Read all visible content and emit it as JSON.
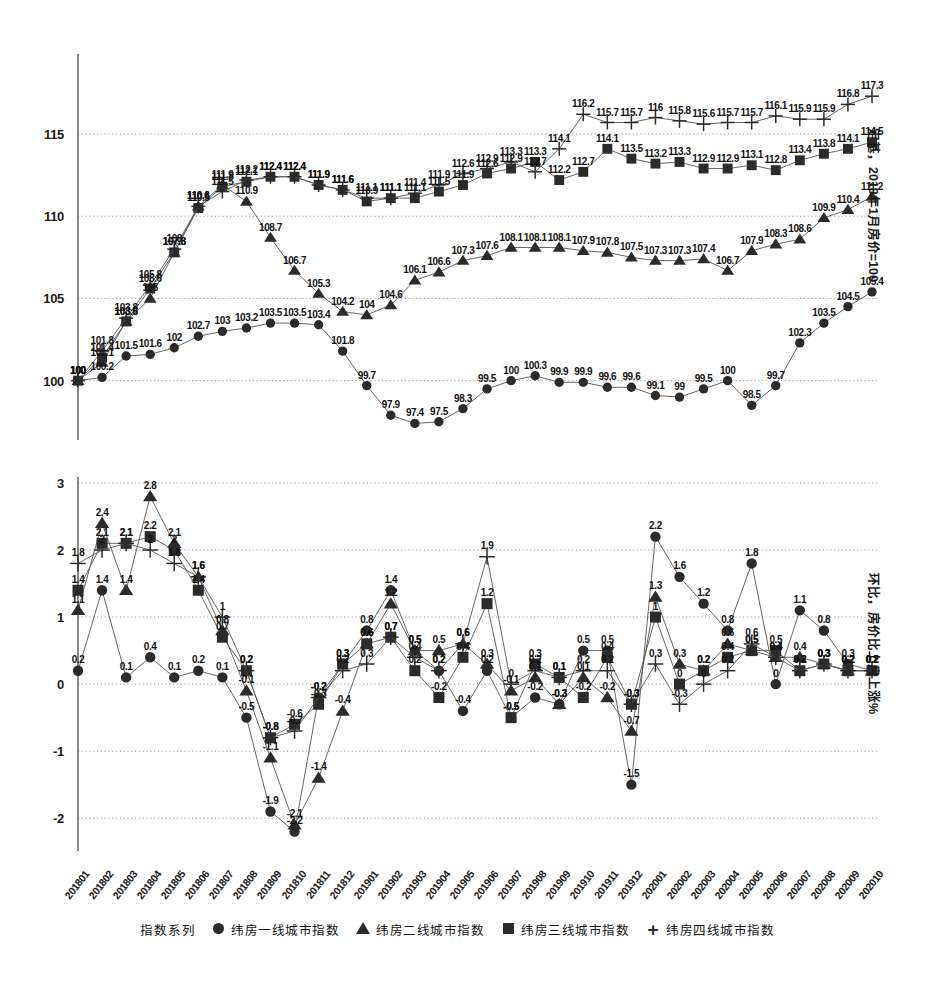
{
  "figure": {
    "background": "#ffffff",
    "ink_color": "#2b2b2b",
    "grid_color": "#9a9a9a"
  },
  "legend": {
    "title": "指数系列",
    "items": [
      {
        "label": "纬房一线城市指数",
        "marker": "circle-marker-icon",
        "key": "tier1"
      },
      {
        "label": "纬房二线城市指数",
        "marker": "triangle-marker-icon",
        "key": "tier2"
      },
      {
        "label": "纬房三线城市指数",
        "marker": "square-marker-icon",
        "key": "tier3"
      },
      {
        "label": "纬房四线城市指数",
        "marker": "plus-marker-icon",
        "key": "tier4"
      }
    ]
  },
  "categories": [
    "201801",
    "201802",
    "201803",
    "201804",
    "201805",
    "201806",
    "201807",
    "201808",
    "201809",
    "201810",
    "201811",
    "201812",
    "201901",
    "201902",
    "201903",
    "201904",
    "201905",
    "201906",
    "201907",
    "201908",
    "201909",
    "201910",
    "201911",
    "201912",
    "202001",
    "202002",
    "202003",
    "202004",
    "202005",
    "202006",
    "202007",
    "202008",
    "202009",
    "202010"
  ],
  "chart_data": [
    {
      "id": "index-chart",
      "type": "line",
      "title": "",
      "xlabel": "",
      "ylabel": "定基，2018年1月房价=100",
      "ylim": [
        97,
        119.5
      ],
      "yticks": [
        100,
        105,
        110,
        115
      ],
      "grid": true,
      "legend_position": "bottom",
      "x": [
        "201801",
        "201802",
        "201803",
        "201804",
        "201805",
        "201806",
        "201807",
        "201808",
        "201809",
        "201810",
        "201811",
        "201812",
        "201901",
        "201902",
        "201903",
        "201904",
        "201905",
        "201906",
        "201907",
        "201908",
        "201909",
        "201910",
        "201911",
        "201912",
        "202001",
        "202002",
        "202003",
        "202004",
        "202005",
        "202006",
        "202007",
        "202008",
        "202009",
        "202010"
      ],
      "series": [
        {
          "name": "纬房一线城市指数",
          "marker": "circle",
          "values": [
            100,
            100.2,
            101.5,
            101.6,
            102,
            102.7,
            103,
            103.2,
            103.5,
            103.5,
            103.4,
            101.8,
            99.7,
            97.9,
            97.4,
            97.5,
            98.3,
            99.5,
            100,
            100.3,
            99.9,
            99.9,
            99.6,
            99.6,
            99.1,
            99,
            99.5,
            100,
            98.5,
            99.7,
            102.3,
            103.5,
            104.5,
            105.4
          ]
        },
        {
          "name": "纬房二线城市指数",
          "marker": "triangle",
          "values": [
            100,
            101.1,
            103.6,
            105,
            107.8,
            110.6,
            111.9,
            110.9,
            108.7,
            106.7,
            105.3,
            104.2,
            104,
            104.6,
            106.1,
            106.6,
            107.3,
            107.6,
            108.1,
            108.1,
            108.1,
            107.9,
            107.8,
            107.5,
            107.3,
            107.3,
            107.4,
            106.7,
            107.9,
            108.3,
            108.6,
            109.9,
            110.4,
            111.2
          ]
        },
        {
          "name": "纬房三线城市指数",
          "marker": "square",
          "values": [
            100,
            101.4,
            103.6,
            105.6,
            107.8,
            110.5,
            111.8,
            112.1,
            112.4,
            112.4,
            111.9,
            111.6,
            110.9,
            111.1,
            111.1,
            111.5,
            111.9,
            112.6,
            112.9,
            113.3,
            112.2,
            112.7,
            114.1,
            113.5,
            113.2,
            113.3,
            112.9,
            112.9,
            113.1,
            112.8,
            113.4,
            113.8,
            114.1,
            114.5,
            115.1,
            115.4,
            115.6,
            115.8,
            115.9
          ]
        },
        {
          "name": "纬房四线城市指数",
          "marker": "plus",
          "values": [
            100,
            101.8,
            103.8,
            105.8,
            108,
            110.6,
            111.5,
            112.2,
            112.4,
            112.4,
            111.9,
            111.6,
            111.1,
            111.1,
            111.4,
            111.9,
            112.6,
            112.9,
            113.3,
            112.7,
            114.1,
            116.2,
            115.7,
            115.7,
            116,
            115.8,
            115.6,
            115.7,
            115.7,
            116.1,
            115.9,
            115.9,
            116.8,
            117.3,
            118,
            118.3,
            118.7
          ]
        }
      ]
    },
    {
      "id": "mom-chart",
      "type": "line",
      "title": "",
      "xlabel": "",
      "ylabel": "环比，房价比上月上涨%",
      "ylim": [
        -2.4,
        3
      ],
      "yticks": [
        -2,
        -1,
        0,
        1,
        2,
        3
      ],
      "grid": true,
      "legend_position": "bottom",
      "x": [
        "201801",
        "201802",
        "201803",
        "201804",
        "201805",
        "201806",
        "201807",
        "201808",
        "201809",
        "201810",
        "201811",
        "201812",
        "201901",
        "201902",
        "201903",
        "201904",
        "201905",
        "201906",
        "201907",
        "201908",
        "201909",
        "201910",
        "201911",
        "201912",
        "202001",
        "202002",
        "202003",
        "202004",
        "202005",
        "202006",
        "202007",
        "202008",
        "202009",
        "202010"
      ],
      "series": [
        {
          "name": "纬房一线城市指数",
          "marker": "circle",
          "values": [
            0.2,
            1.4,
            0.1,
            0.4,
            0.1,
            0.2,
            0.1,
            -0.5,
            -1.9,
            -2.2,
            -0.2,
            0.3,
            0.8,
            1.4,
            0.5,
            0.2,
            -0.4,
            0.2,
            -0.5,
            -0.2,
            -0.3,
            0.5,
            0.5,
            -1.5,
            2.2,
            1.6,
            1.2,
            0.8,
            1.8,
            0,
            1.1,
            0.8,
            0.3,
            0.2
          ]
        },
        {
          "name": "纬房二线城市指数",
          "marker": "triangle",
          "values": [
            1.1,
            2.4,
            1.4,
            2.8,
            2.1,
            1.6,
            0.8,
            -0.1,
            -1.1,
            -2.1,
            -1.4,
            -0.4,
            0.6,
            1.2,
            0.5,
            0.5,
            0.6,
            0.3,
            -0.1,
            0.1,
            -0.3,
            0.1,
            -0.2,
            -0.7,
            1.3,
            0.3,
            0.2,
            0.6,
            0.5,
            0.4,
            0.4,
            0.3,
            0.2,
            0.2
          ]
        },
        {
          "name": "纬房三线城市指数",
          "marker": "square",
          "values": [
            1.4,
            2.1,
            2.1,
            2.2,
            2,
            1.4,
            0.7,
            0.2,
            -0.8,
            -0.6,
            -0.3,
            0.3,
            0.6,
            0.7,
            0.2,
            -0.2,
            0.4,
            1.2,
            -0.5,
            0.3,
            0.1,
            -0.2,
            0.4,
            -0.3,
            1,
            0,
            0.2,
            0.4,
            0.5,
            0.5,
            0.2,
            0.3,
            0.2,
            0.2
          ]
        },
        {
          "name": "纬房四线城市指数",
          "marker": "plus",
          "values": [
            1.8,
            2,
            2.1,
            2,
            1.8,
            1.6,
            1,
            0.2,
            -0.8,
            -0.7,
            -0.2,
            0.2,
            0.3,
            0.7,
            0.4,
            0.2,
            0.6,
            1.9,
            0,
            0.2,
            0.1,
            0.2,
            0.2,
            -0.3,
            0.3,
            -0.3,
            0,
            0.2,
            0.6,
            0.4,
            0.2,
            0.3,
            0.2,
            0.2
          ]
        }
      ]
    }
  ],
  "axes": {
    "top": {
      "right_title": "定基，2018年1月房价=100",
      "yticks": [
        "100",
        "105",
        "110",
        "115"
      ]
    },
    "bottom": {
      "right_title": "环比，房价比上月上涨%",
      "yticks": [
        "3",
        "2",
        "1",
        "0",
        "-1",
        "-2"
      ]
    }
  }
}
